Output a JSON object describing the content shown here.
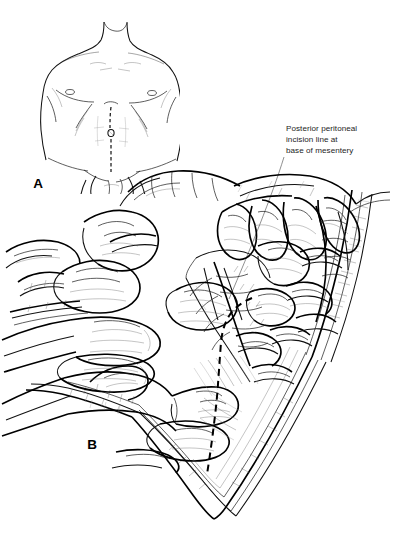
{
  "figure": {
    "kind": "surgical-line-illustration",
    "medium": "pen-and-ink",
    "background_color": "#ffffff",
    "ink_color": "#1a1a1a",
    "width_px": 399,
    "height_px": 542,
    "procedure": "Medial visceral rotation / exposure of base of small bowel mesentery via midline laparotomy"
  },
  "panels": [
    {
      "id": "A",
      "letter": "A",
      "letter_x": 38,
      "letter_y": 188,
      "caption": "",
      "subject": "anterior male torso, supine, showing planned skin incision",
      "incision": {
        "name": "midline laparotomy incision",
        "style": "dashed",
        "orientation": "vertical midline, xiphoid to pubis, around umbilicus"
      }
    },
    {
      "id": "B",
      "letter": "B",
      "letter_x": 92,
      "letter_y": 449,
      "caption": "",
      "subject": "open abdomen, surgeon's hands retracting small bowel loops superiorly and to the right, exposing the root of the mesentery",
      "incision": {
        "name": "posterior peritoneal incision line at base of mesentery",
        "style": "dashed",
        "orientation": "curvilinear, running from upper right inferiorly and to the left toward the pelvic brim"
      }
    }
  ],
  "annotations": [
    {
      "id": "posterior-peritoneal-incision",
      "lines": [
        "Posterior peritoneal",
        "incision line at",
        "base of mesentery"
      ],
      "text_x": 286,
      "text_y": 131,
      "leader": {
        "from_x": 284,
        "from_y": 150,
        "to_x": 228,
        "to_y": 300
      }
    }
  ],
  "anatomy_labels_visible": [],
  "colors": {
    "ink": "#1a1a1a",
    "ink_bold": "#000000",
    "ink_faint": "#6d6d6d",
    "background": "#ffffff",
    "text": "#1d1d1d"
  }
}
